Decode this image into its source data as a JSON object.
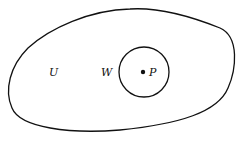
{
  "diagram": {
    "regions": [
      {
        "id": "outer-region",
        "label": "U"
      },
      {
        "id": "inner-disk",
        "label": "W"
      }
    ],
    "point": {
      "label": "P"
    },
    "line_color": "#111111"
  }
}
